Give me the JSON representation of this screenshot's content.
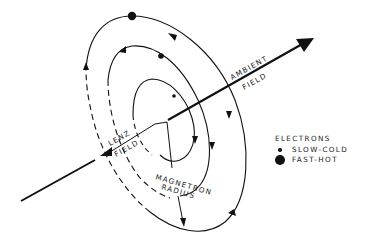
{
  "diagram": {
    "labels": {
      "ambient_line1": "AMBIENT",
      "ambient_line2": "FIELD",
      "lenz_line1": "LENZ",
      "lenz_line2": "FIELD",
      "magnetron_line1": "MAGNETRON",
      "magnetron_line2": "RADIUS"
    },
    "legend": {
      "title": "ELECTRONS",
      "items": [
        {
          "marker": "small-dot",
          "label": "SLOW-COLD"
        },
        {
          "marker": "large-dot",
          "label": "FAST-HOT"
        }
      ]
    },
    "colors": {
      "ink": "#111111",
      "background": "#ffffff"
    }
  }
}
